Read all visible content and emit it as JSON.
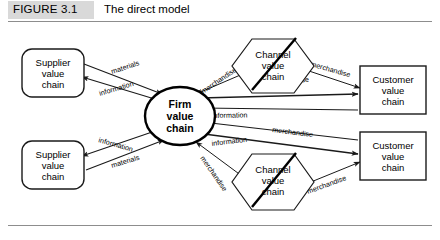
{
  "figure": {
    "tag": "FIGURE 3.1",
    "title": "The direct model",
    "tag_bg_color": "#d9d9d9",
    "rule_color": "#8d8d8d"
  },
  "diagram": {
    "type": "flow-diagram",
    "nodes": [
      {
        "id": "supplier-top",
        "shape": "rounded-rectangle",
        "lines": [
          "Supplier",
          "value",
          "chain"
        ],
        "line1": "Supplier",
        "line2": "value",
        "line3": "chain"
      },
      {
        "id": "supplier-bottom",
        "shape": "rounded-rectangle",
        "lines": [
          "Supplier",
          "value",
          "chain"
        ],
        "line1": "Supplier",
        "line2": "value",
        "line3": "chain"
      },
      {
        "id": "firm",
        "shape": "ellipse",
        "lines": [
          "Firm",
          "value",
          "chain"
        ],
        "line1": "Firm",
        "line2": "value",
        "line3": "chain"
      },
      {
        "id": "channel-top",
        "shape": "hexagon-struck-through",
        "lines": [
          "Channel",
          "value",
          "chain"
        ],
        "line1": "Channel",
        "line2": "value",
        "line3": "chain"
      },
      {
        "id": "channel-bottom",
        "shape": "hexagon-struck-through",
        "lines": [
          "Channel",
          "value",
          "chain"
        ],
        "line1": "Channel",
        "line2": "value",
        "line3": "chain"
      },
      {
        "id": "customer-top",
        "shape": "rectangle",
        "lines": [
          "Customer",
          "value",
          "chain"
        ],
        "line1": "Customer",
        "line2": "value",
        "line3": "chain"
      },
      {
        "id": "customer-bottom",
        "shape": "rectangle",
        "lines": [
          "Customer",
          "value",
          "chain"
        ],
        "line1": "Customer",
        "line2": "value",
        "line3": "chain"
      }
    ],
    "edges": [
      {
        "id": "firm-to-supplier-top",
        "label": "information",
        "from": "firm",
        "to": "supplier-top"
      },
      {
        "id": "supplier-top-to-firm",
        "label": "materials",
        "from": "supplier-top",
        "to": "firm"
      },
      {
        "id": "firm-to-supplier-bottom",
        "label": "information",
        "from": "firm",
        "to": "supplier-bottom"
      },
      {
        "id": "supplier-bottom-to-firm",
        "label": "materials",
        "from": "supplier-bottom",
        "to": "firm"
      },
      {
        "id": "channel-top-to-firm",
        "label": "merchandise",
        "from": "channel-top",
        "to": "firm"
      },
      {
        "id": "channel-top-to-customer",
        "label": "merchandise",
        "from": "channel-top",
        "to": "customer-top"
      },
      {
        "id": "customer-top-to-firm",
        "label": "information",
        "from": "customer-top",
        "to": "firm"
      },
      {
        "id": "firm-to-customer-top",
        "label": "merchandise",
        "from": "firm",
        "to": "customer-top"
      },
      {
        "id": "customer-bottom-to-firm",
        "label": "information",
        "from": "customer-bottom",
        "to": "firm"
      },
      {
        "id": "firm-to-customer-bottom",
        "label": "merchandise",
        "from": "firm",
        "to": "customer-bottom"
      },
      {
        "id": "channel-bottom-to-firm",
        "label": "merchandise",
        "from": "channel-bottom",
        "to": "firm"
      },
      {
        "id": "channel-bottom-to-customer",
        "label": "merchandise",
        "from": "channel-bottom",
        "to": "customer-bottom"
      }
    ]
  }
}
